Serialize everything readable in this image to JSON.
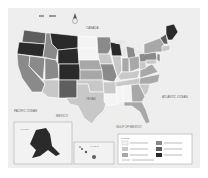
{
  "map": {
    "type": "choropleth",
    "subject": "United States by state",
    "colors": {
      "background": "#eeeeee",
      "water": "#e6e6e6",
      "land_other": "#f2f2f2",
      "border": "#ffffff",
      "class1": "#f4f4f4",
      "class2": "#c8c8c8",
      "class3": "#a8a8a8",
      "class4": "#8a8a8a",
      "class5": "#5e5e5e",
      "class6": "#2a2a2a"
    },
    "labels": {
      "canada": "CANADA",
      "mexico": "MEXICO",
      "pacific": "PACIFIC OCEAN",
      "atlantic": "ATLANTIC OCEAN",
      "gulf": "GULF OF MEXICO",
      "texas": "TEXAS"
    },
    "insets": {
      "alaska": "ALASKA",
      "hawaii": "HAWAII"
    },
    "legend": {
      "title": "Legend",
      "classes": [
        {
          "label": "Class 1",
          "color": "#f4f4f4"
        },
        {
          "label": "Class 2",
          "color": "#c8c8c8"
        },
        {
          "label": "Class 3",
          "color": "#a8a8a8"
        },
        {
          "label": "Class 4",
          "color": "#8a8a8a"
        },
        {
          "label": "Class 5",
          "color": "#5e5e5e"
        },
        {
          "label": "Class 6",
          "color": "#2a2a2a"
        }
      ]
    }
  }
}
